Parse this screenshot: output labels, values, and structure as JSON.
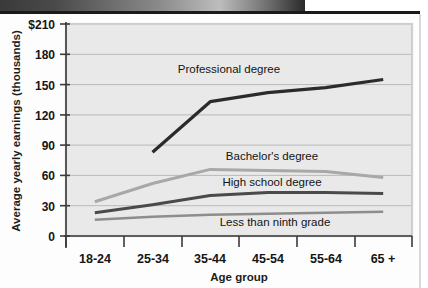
{
  "chart_data": {
    "type": "line",
    "title": "",
    "subtitle": "",
    "xlabel": "Age group",
    "ylabel": "Average yearly earnings (thousands)",
    "categories": [
      "18-24",
      "25-34",
      "35-44",
      "45-54",
      "55-64",
      "65 +"
    ],
    "ytick_labels": [
      "$210",
      "180",
      "150",
      "120",
      "90",
      "60",
      "30",
      "0"
    ],
    "ytick_values": [
      210,
      180,
      150,
      120,
      90,
      60,
      30,
      0
    ],
    "ylim": [
      0,
      210
    ],
    "grid": "horizontal",
    "legend_position": "inline-annotations",
    "series": [
      {
        "name": "Professional degree",
        "color": "#2b2b2b",
        "width": 3.2,
        "values": [
          null,
          83,
          133,
          142,
          147,
          155
        ],
        "label_x": "35-44",
        "label_text": "Professional degree"
      },
      {
        "name": "Bachelor's degree",
        "color": "#a8a8a8",
        "width": 3.0,
        "values": [
          34,
          52,
          66,
          65,
          64,
          58
        ],
        "label_text": "Bachelor's degree"
      },
      {
        "name": "High school degree",
        "color": "#4a4a4a",
        "width": 3.0,
        "values": [
          23,
          31,
          40,
          43,
          43,
          42
        ],
        "label_text": "High school degree"
      },
      {
        "name": "Less than ninth grade",
        "color": "#8d8d8d",
        "width": 2.6,
        "values": [
          16,
          19,
          21,
          22,
          23,
          24
        ],
        "label_text": "Less than ninth grade"
      }
    ],
    "annotations": [
      {
        "name": "professional-degree-label",
        "text": "Professional degree"
      },
      {
        "name": "bachelors-degree-label",
        "text": "Bachelor's degree"
      },
      {
        "name": "high-school-degree-label",
        "text": "High school degree"
      },
      {
        "name": "less-than-ninth-grade-label",
        "text": "Less than ninth grade"
      }
    ],
    "colors": {
      "plot_background": "#e9e9e9",
      "gridline": "#b9b9b9",
      "axis": "#3a3a3a",
      "page_background": "#fdfdfd"
    }
  },
  "axes": {
    "y_title": "Average yearly earnings (thousands)",
    "x_title": "Age group",
    "y_labels": {
      "t0": "$210",
      "t1": "180",
      "t2": "150",
      "t3": "120",
      "t4": "90",
      "t5": "60",
      "t6": "30",
      "t7": "0"
    },
    "x_labels": {
      "c0": "18-24",
      "c1": "25-34",
      "c2": "35-44",
      "c3": "45-54",
      "c4": "55-64",
      "c5": "65 +"
    }
  },
  "labels": {
    "professional": "Professional degree",
    "bachelors": "Bachelor's degree",
    "highschool": "High school degree",
    "ninthgrade": "Less than ninth grade"
  }
}
